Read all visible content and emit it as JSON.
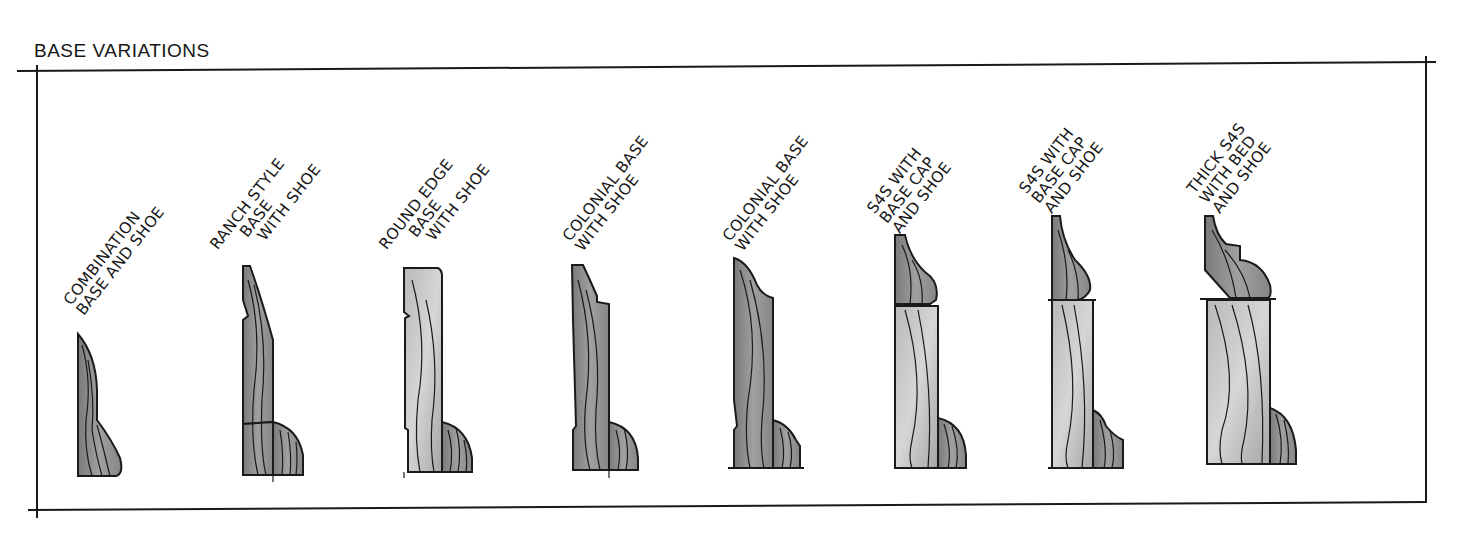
{
  "title": "BASE VARIATIONS",
  "colors": {
    "ink": "#1a1a1a",
    "wood_fill": "#8a8a8a",
    "wood_light": "#c4c4c4",
    "paper": "#ffffff"
  },
  "profiles": [
    {
      "id": "combination",
      "lines": [
        "COMBINATION",
        "BASE AND SHOE"
      ]
    },
    {
      "id": "ranch",
      "lines": [
        "RANCH STYLE",
        "BASE",
        "WITH SHOE"
      ]
    },
    {
      "id": "round-edge",
      "lines": [
        "ROUND EDGE",
        "BASE",
        "WITH SHOE"
      ]
    },
    {
      "id": "colonial-1",
      "lines": [
        "COLONIAL BASE",
        "WITH SHOE"
      ]
    },
    {
      "id": "colonial-2",
      "lines": [
        "COLONIAL BASE",
        "WITH SHOE"
      ]
    },
    {
      "id": "s4s-basecap-1",
      "lines": [
        "S4S WITH",
        "BASE CAP",
        "AND SHOE"
      ]
    },
    {
      "id": "s4s-basecap-2",
      "lines": [
        "S4S WITH",
        "BASE CAP",
        "AND SHOE"
      ]
    },
    {
      "id": "thick-s4s",
      "lines": [
        "THICK S4S",
        "WITH BED",
        "AND SHOE"
      ]
    }
  ]
}
